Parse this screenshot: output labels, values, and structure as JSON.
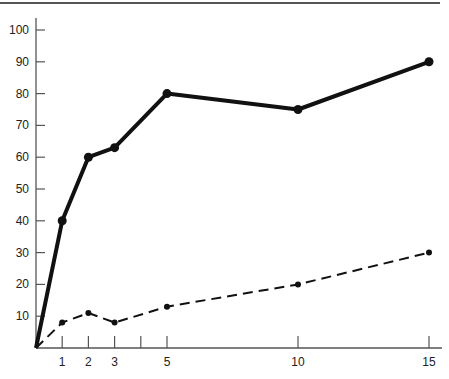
{
  "chart_data": {
    "type": "line",
    "title": "",
    "xlabel": "",
    "ylabel": "",
    "x": [
      0,
      1,
      2,
      3,
      5,
      10,
      15
    ],
    "x_ticks": [
      1,
      2,
      3,
      4,
      5,
      10,
      15
    ],
    "x_tick_labels": [
      "1",
      "2",
      "3",
      "",
      "5",
      "10",
      "15"
    ],
    "y_ticks": [
      10,
      20,
      30,
      40,
      50,
      60,
      70,
      80,
      90,
      100
    ],
    "y_tick_labels": [
      "10",
      "20",
      "30",
      "40",
      "50",
      "60",
      "70",
      "80",
      "90",
      "100"
    ],
    "xlim": [
      0,
      16
    ],
    "ylim": [
      0,
      100
    ],
    "grid": false,
    "legend": null,
    "series": [
      {
        "name": "solid",
        "style": "solid-thick",
        "color": "#111111",
        "values": [
          0,
          40,
          60,
          63,
          80,
          75,
          90
        ]
      },
      {
        "name": "dashed",
        "style": "dashed",
        "color": "#111111",
        "values": [
          0,
          8,
          11,
          8,
          13,
          20,
          30
        ]
      }
    ]
  }
}
